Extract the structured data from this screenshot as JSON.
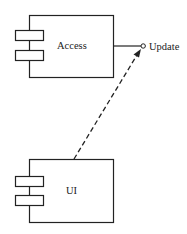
{
  "diagram": {
    "type": "UML component diagram",
    "components": [
      {
        "id": "access",
        "label": "Access"
      },
      {
        "id": "ui",
        "label": "UI"
      }
    ],
    "interfaces": [
      {
        "id": "update",
        "label": "Update",
        "provided_by": "access"
      }
    ],
    "dependencies": [
      {
        "from": "ui",
        "to": "update",
        "style": "dashed-arrow"
      }
    ],
    "colors": {
      "stroke": "#222222",
      "background": "#ffffff"
    }
  }
}
